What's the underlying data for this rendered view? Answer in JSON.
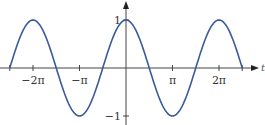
{
  "chart_data": {
    "type": "line",
    "title": "",
    "function": "y = cos(t)",
    "xlabel": "t",
    "ylabel": "",
    "x_range": [
      -7.85398,
      7.85398
    ],
    "ylim": [
      -1,
      1
    ],
    "x_ticks": [
      {
        "value": -6.28319,
        "label": "−2π"
      },
      {
        "value": -3.14159,
        "label": "−π"
      },
      {
        "value": 3.14159,
        "label": "π"
      },
      {
        "value": 6.28319,
        "label": "2π"
      }
    ],
    "y_ticks": [
      {
        "value": 1,
        "label": "1"
      },
      {
        "value": -1,
        "label": "−1"
      }
    ],
    "series": [
      {
        "name": "cos t",
        "color": "#3b5b9b",
        "x": [
          -7.854,
          -6.283,
          -4.712,
          -3.142,
          -1.571,
          0,
          1.571,
          3.142,
          4.712,
          6.283,
          7.854
        ],
        "y": [
          0,
          1,
          0,
          -1,
          0,
          1,
          0,
          -1,
          0,
          1,
          0
        ]
      }
    ],
    "grid": false,
    "legend": "none"
  },
  "colors": {
    "curve": "#3b5b9b",
    "axis": "#444444"
  }
}
